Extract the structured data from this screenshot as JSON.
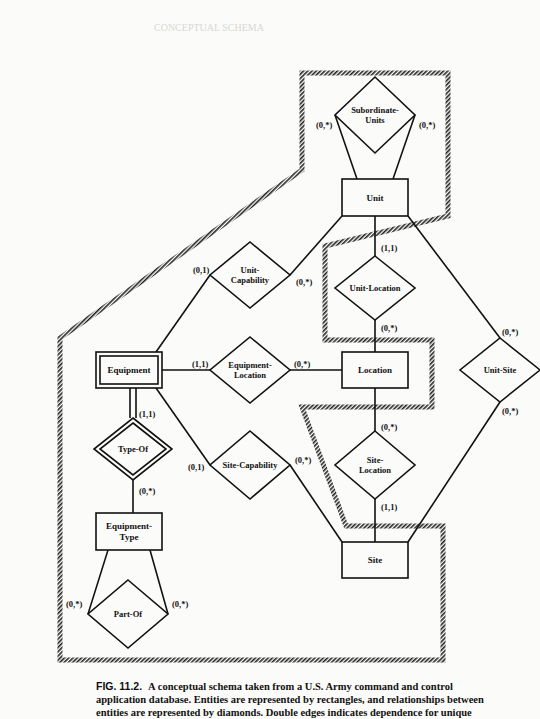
{
  "page": {
    "ghost_header": "CONCEPTUAL SCHEMA"
  },
  "caption": {
    "figure_label": "FIG. 11.2.",
    "lines": [
      "A conceptual schema taken from a U.S. Army command and control",
      "application database. Entities are represented by rectangles, and relationships between",
      "entities are represented by diamonds. Double edges indicates dependence for unique"
    ]
  },
  "diagram": {
    "colors": {
      "ink": "#111111",
      "paper": "#fbfbf9",
      "hatch": "#222222"
    },
    "outline": {
      "points": [
        [
          302,
          73
        ],
        [
          448,
          73
        ],
        [
          448,
          216
        ],
        [
          325,
          246
        ],
        [
          325,
          340
        ],
        [
          432,
          340
        ],
        [
          432,
          407
        ],
        [
          302,
          407
        ],
        [
          346,
          526
        ],
        [
          443,
          526
        ],
        [
          443,
          660
        ],
        [
          60,
          660
        ],
        [
          60,
          338
        ],
        [
          302,
          170
        ]
      ]
    },
    "entities": [
      {
        "id": "unit",
        "label": [
          "Unit"
        ],
        "x": 342,
        "y": 179,
        "w": 66,
        "h": 37,
        "weak": false
      },
      {
        "id": "location",
        "label": [
          "Location"
        ],
        "x": 342,
        "y": 352,
        "w": 66,
        "h": 36,
        "weak": false
      },
      {
        "id": "equipment",
        "label": [
          "Equipment"
        ],
        "x": 96,
        "y": 352,
        "w": 66,
        "h": 36,
        "weak": true
      },
      {
        "id": "equipment-type",
        "label": [
          "Equipment-",
          "Type"
        ],
        "x": 96,
        "y": 513,
        "w": 66,
        "h": 37,
        "weak": false
      },
      {
        "id": "site",
        "label": [
          "Site"
        ],
        "x": 342,
        "y": 542,
        "w": 66,
        "h": 36,
        "weak": false
      }
    ],
    "relationships": [
      {
        "id": "subordinate-units",
        "label": [
          "Subordinate-",
          "Units"
        ],
        "cx": 375,
        "cy": 115,
        "hw": 40,
        "hh": 38,
        "weak": false
      },
      {
        "id": "unit-capability",
        "label": [
          "Unit-",
          "Capability"
        ],
        "cx": 250,
        "cy": 275,
        "hw": 40,
        "hh": 33,
        "weak": false
      },
      {
        "id": "unit-location",
        "label": [
          "Unit-Location"
        ],
        "cx": 375,
        "cy": 288,
        "hw": 40,
        "hh": 32,
        "weak": false
      },
      {
        "id": "equipment-location",
        "label": [
          "Equipment-",
          "Location"
        ],
        "cx": 250,
        "cy": 370,
        "hw": 40,
        "hh": 33,
        "weak": false
      },
      {
        "id": "unit-site",
        "label": [
          "Unit-Site"
        ],
        "cx": 500,
        "cy": 370,
        "hw": 40,
        "hh": 32,
        "weak": false
      },
      {
        "id": "type-of",
        "label": [
          "Type-Of"
        ],
        "cx": 133,
        "cy": 449,
        "hw": 39,
        "hh": 31,
        "weak": true
      },
      {
        "id": "site-capability",
        "label": [
          "Site-Capability"
        ],
        "cx": 250,
        "cy": 465,
        "hw": 40,
        "hh": 34,
        "weak": false
      },
      {
        "id": "site-location",
        "label": [
          "Site-",
          "Location"
        ],
        "cx": 375,
        "cy": 465,
        "hw": 40,
        "hh": 34,
        "weak": false
      },
      {
        "id": "part-of",
        "label": [
          "Part-Of"
        ],
        "cx": 128,
        "cy": 614,
        "hw": 40,
        "hh": 34,
        "weak": false
      }
    ],
    "edges": [
      {
        "from": [
          335,
          115
        ],
        "to": [
          357,
          179
        ],
        "double": false
      },
      {
        "from": [
          415,
          115
        ],
        "to": [
          393,
          179
        ],
        "double": false
      },
      {
        "from": [
          290,
          275
        ],
        "to": [
          342,
          216
        ],
        "double": false
      },
      {
        "from": [
          210,
          275
        ],
        "to": [
          156,
          352
        ],
        "double": false
      },
      {
        "from": [
          375,
          216
        ],
        "to": [
          375,
          256
        ],
        "double": false
      },
      {
        "from": [
          375,
          320
        ],
        "to": [
          375,
          352
        ],
        "double": false
      },
      {
        "from": [
          408,
          216
        ],
        "to": [
          500,
          338
        ],
        "double": false
      },
      {
        "from": [
          500,
          402
        ],
        "to": [
          408,
          542
        ],
        "double": false
      },
      {
        "from": [
          162,
          370
        ],
        "to": [
          210,
          370
        ],
        "double": false
      },
      {
        "from": [
          290,
          370
        ],
        "to": [
          342,
          370
        ],
        "double": false
      },
      {
        "from": [
          133,
          388
        ],
        "to": [
          133,
          418
        ],
        "double": true
      },
      {
        "from": [
          133,
          480
        ],
        "to": [
          133,
          513
        ],
        "double": false
      },
      {
        "from": [
          156,
          388
        ],
        "to": [
          210,
          465
        ],
        "double": false
      },
      {
        "from": [
          290,
          465
        ],
        "to": [
          342,
          542
        ],
        "double": false
      },
      {
        "from": [
          375,
          388
        ],
        "to": [
          375,
          431
        ],
        "double": false
      },
      {
        "from": [
          375,
          499
        ],
        "to": [
          375,
          542
        ],
        "double": false
      },
      {
        "from": [
          108,
          550
        ],
        "to": [
          88,
          614
        ],
        "double": false
      },
      {
        "from": [
          150,
          550
        ],
        "to": [
          168,
          614
        ],
        "double": false
      }
    ],
    "cardinalities": [
      {
        "text": "(0,*)",
        "x": 316,
        "y": 128
      },
      {
        "text": "(0,*)",
        "x": 419,
        "y": 128
      },
      {
        "text": "(0,1)",
        "x": 193,
        "y": 273
      },
      {
        "text": "(0,*)",
        "x": 296,
        "y": 285
      },
      {
        "text": "(1,1)",
        "x": 381,
        "y": 251
      },
      {
        "text": "(0,*)",
        "x": 381,
        "y": 331
      },
      {
        "text": "(0,*)",
        "x": 502,
        "y": 335
      },
      {
        "text": "(0,*)",
        "x": 502,
        "y": 414
      },
      {
        "text": "(1,1)",
        "x": 192,
        "y": 367
      },
      {
        "text": "(0,*)",
        "x": 294,
        "y": 367
      },
      {
        "text": "(1,1)",
        "x": 139,
        "y": 417
      },
      {
        "text": "(0,*)",
        "x": 139,
        "y": 494
      },
      {
        "text": "(0,1)",
        "x": 188,
        "y": 470
      },
      {
        "text": "(0,*)",
        "x": 295,
        "y": 463
      },
      {
        "text": "(0,*)",
        "x": 381,
        "y": 430
      },
      {
        "text": "(1,1)",
        "x": 381,
        "y": 510
      },
      {
        "text": "(0,*)",
        "x": 66,
        "y": 607
      },
      {
        "text": "(0,*)",
        "x": 172,
        "y": 607
      }
    ]
  }
}
